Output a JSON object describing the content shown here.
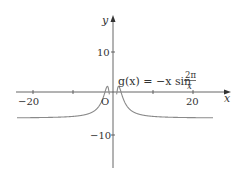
{
  "chart_data": {
    "type": "line",
    "title": "",
    "xlabel": "x",
    "ylabel": "y",
    "xlim": [
      -25,
      25
    ],
    "ylim": [
      -17,
      16
    ],
    "grid": false,
    "x_ticks": [
      -20,
      -10,
      10,
      20
    ],
    "x_tick_labels": [
      "−20",
      "20"
    ],
    "y_ticks": [
      10,
      -10
    ],
    "y_tick_labels": [
      "10",
      "−10"
    ],
    "origin_label": "O",
    "series": [
      {
        "name": "g(x) = −x sin(2π/x)",
        "function": "-x*sin(2*pi/x)",
        "x_range": [
          -24,
          25
        ],
        "sample_points": [
          {
            "x": -24,
            "y": -6.1
          },
          {
            "x": -20,
            "y": -6.0
          },
          {
            "x": -10,
            "y": -5.9
          },
          {
            "x": -5,
            "y": -4.8
          },
          {
            "x": -3,
            "y": -2.6
          },
          {
            "x": -2,
            "y": 0.0
          },
          {
            "x": -1.5,
            "y": 1.3
          },
          {
            "x": -1,
            "y": 0.0
          },
          {
            "x": 1,
            "y": 0.0
          },
          {
            "x": 1.5,
            "y": 1.3
          },
          {
            "x": 2,
            "y": 0.0
          },
          {
            "x": 3,
            "y": -2.6
          },
          {
            "x": 5,
            "y": -4.8
          },
          {
            "x": 10,
            "y": -5.9
          },
          {
            "x": 20,
            "y": -6.0
          },
          {
            "x": 25,
            "y": -6.1
          }
        ]
      }
    ],
    "annotations": [
      {
        "text": "g(x) = −x sin 2π/x",
        "position": "above x-axis, right of y-axis"
      }
    ]
  },
  "labels": {
    "x_axis": "x",
    "y_axis": "y",
    "origin": "O",
    "tick_x_neg20": "−20",
    "tick_x_20": "20",
    "tick_y_10": "10",
    "tick_y_neg10": "−10",
    "eq_lhs": "g(x) = −x sin",
    "eq_num": "2π",
    "eq_den": "x"
  }
}
